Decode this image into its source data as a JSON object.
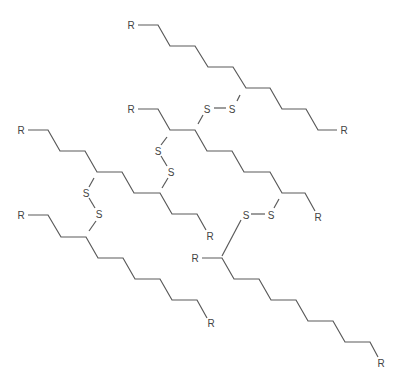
{
  "diagram": {
    "type": "chemical-structure",
    "colors": {
      "bond": "#5a5a5a",
      "label": "#444444",
      "background": "#ffffff"
    },
    "labels": {
      "r": "R",
      "s": "S"
    },
    "chains": [
      {
        "id": "chain-1",
        "points": [
          [
            138,
            25
          ],
          [
            158,
            25
          ],
          [
            170,
            46
          ],
          [
            195,
            46
          ],
          [
            208,
            67
          ],
          [
            233,
            67
          ],
          [
            246,
            88
          ],
          [
            270,
            88
          ],
          [
            282,
            109
          ],
          [
            306,
            109
          ],
          [
            318,
            130
          ],
          [
            337,
            130
          ]
        ]
      },
      {
        "id": "chain-2",
        "points": [
          [
            138,
            109
          ],
          [
            158,
            109
          ],
          [
            170,
            130
          ],
          [
            195,
            130
          ],
          [
            207,
            151
          ],
          [
            232,
            151
          ],
          [
            244,
            172
          ],
          [
            270,
            172
          ],
          [
            282,
            193
          ],
          [
            305,
            193
          ],
          [
            315,
            211
          ]
        ]
      },
      {
        "id": "chain-3",
        "points": [
          [
            28,
            130
          ],
          [
            48,
            130
          ],
          [
            60,
            151
          ],
          [
            85,
            151
          ],
          [
            97,
            172
          ],
          [
            122,
            172
          ],
          [
            134,
            193
          ],
          [
            160,
            193
          ],
          [
            172,
            214
          ],
          [
            197,
            214
          ],
          [
            206,
            230
          ]
        ]
      },
      {
        "id": "chain-4",
        "points": [
          [
            28,
            215
          ],
          [
            48,
            215
          ],
          [
            61,
            237
          ],
          [
            86,
            237
          ],
          [
            98,
            258
          ],
          [
            123,
            258
          ],
          [
            135,
            279
          ],
          [
            160,
            279
          ],
          [
            172,
            300
          ],
          [
            197,
            300
          ],
          [
            207,
            318
          ]
        ]
      },
      {
        "id": "chain-5",
        "points": [
          [
            202,
            258
          ],
          [
            222,
            258
          ],
          [
            234,
            279
          ],
          [
            259,
            279
          ],
          [
            271,
            300
          ],
          [
            296,
            300
          ],
          [
            308,
            321
          ],
          [
            333,
            321
          ],
          [
            345,
            342
          ],
          [
            370,
            342
          ],
          [
            378,
            357
          ]
        ]
      }
    ],
    "disulfide_bridges": [
      {
        "id": "ss-1",
        "from": [
          246,
          88
        ],
        "s1": [
          232,
          108
        ],
        "s2": [
          208,
          108
        ],
        "to": [
          195,
          130
        ],
        "bond": [
          [
            237,
            101
          ],
          [
            240,
            95
          ]
        ],
        "ss_bond": [
          [
            214,
            108
          ],
          [
            226,
            108
          ]
        ],
        "end_bond": [
          [
            203,
            115
          ],
          [
            198,
            124
          ]
        ]
      },
      {
        "id": "ss-2",
        "from": [
          170,
          130
        ],
        "s1": [
          158,
          151
        ],
        "s2": [
          171,
          172
        ],
        "to": [
          160,
          193
        ],
        "bond": [
          [
            167,
            137
          ],
          [
            161,
            145
          ]
        ],
        "ss_bond": [
          [
            161,
            156
          ],
          [
            167,
            166
          ]
        ],
        "end_bond": [
          [
            168,
            178
          ],
          [
            162,
            188
          ]
        ]
      },
      {
        "id": "ss-3",
        "from": [
          97,
          172
        ],
        "s1": [
          86,
          193
        ],
        "s2": [
          99,
          214
        ],
        "to": [
          86,
          237
        ],
        "bond": [
          [
            94,
            178
          ],
          [
            89,
            187
          ]
        ],
        "ss_bond": [
          [
            89,
            198
          ],
          [
            95,
            208
          ]
        ],
        "end_bond": [
          [
            96,
            221
          ],
          [
            89,
            231
          ]
        ]
      },
      {
        "id": "ss-4",
        "from": [
          282,
          193
        ],
        "s1": [
          271,
          214
        ],
        "s2": [
          245,
          214
        ],
        "to": [
          222,
          258
        ],
        "bond": [
          [
            279,
            199
          ],
          [
            274,
            208
          ]
        ],
        "ss_bond": [
          [
            251,
            214
          ],
          [
            265,
            214
          ]
        ],
        "end_bond": [
          [
            241,
            220
          ],
          [
            222,
            256
          ]
        ]
      }
    ],
    "atoms": [
      {
        "label": "R",
        "x": 131,
        "y": 25
      },
      {
        "label": "R",
        "x": 344,
        "y": 130
      },
      {
        "label": "R",
        "x": 131,
        "y": 109
      },
      {
        "label": "R",
        "x": 318,
        "y": 217
      },
      {
        "label": "R",
        "x": 21,
        "y": 130
      },
      {
        "label": "R",
        "x": 210,
        "y": 236
      },
      {
        "label": "R",
        "x": 21,
        "y": 215
      },
      {
        "label": "R",
        "x": 211,
        "y": 323
      },
      {
        "label": "R",
        "x": 195,
        "y": 258
      },
      {
        "label": "R",
        "x": 381,
        "y": 363
      },
      {
        "label": "S",
        "x": 232,
        "y": 109
      },
      {
        "label": "S",
        "x": 207,
        "y": 109
      },
      {
        "label": "S",
        "x": 158,
        "y": 151
      },
      {
        "label": "S",
        "x": 171,
        "y": 172
      },
      {
        "label": "S",
        "x": 86,
        "y": 193
      },
      {
        "label": "S",
        "x": 99,
        "y": 214
      },
      {
        "label": "S",
        "x": 271,
        "y": 215
      },
      {
        "label": "S",
        "x": 246,
        "y": 215
      }
    ]
  }
}
